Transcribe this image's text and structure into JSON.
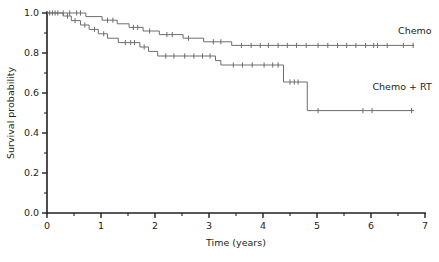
{
  "chart_data": {
    "type": "line",
    "title": "",
    "subtitle": "",
    "xlabel": "Time (years)",
    "ylabel": "Survival probability",
    "xlim": [
      0,
      7
    ],
    "ylim": [
      0,
      1.0
    ],
    "xticks": [
      0,
      1,
      2,
      3,
      4,
      5,
      6,
      7
    ],
    "xtick_labels": [
      "0",
      "1",
      "2",
      "3",
      "4",
      "5",
      "6",
      "7"
    ],
    "xminor_ticks": [
      0.5,
      1.5,
      2.5,
      3.5,
      4.5,
      5.5,
      6.5
    ],
    "yticks": [
      0.0,
      0.2,
      0.4,
      0.6,
      0.8,
      1.0
    ],
    "ytick_labels": [
      "0.0",
      "0.2",
      "0.4",
      "0.6",
      "0.8",
      "1.0"
    ],
    "yminor_ticks": [
      0.1,
      0.3,
      0.5,
      0.7,
      0.9
    ],
    "grid": false,
    "legend_position": "inline-right",
    "line_color": "#6e6e6e",
    "axis_color": "#231f20",
    "series": [
      {
        "name": "Chemo",
        "label": "Chemo",
        "label_x": 6.05,
        "label_y": 0.895,
        "steps": [
          [
            0.0,
            1.0
          ],
          [
            0.72,
            0.982
          ],
          [
            1.02,
            0.964
          ],
          [
            1.3,
            0.946
          ],
          [
            1.52,
            0.928
          ],
          [
            1.78,
            0.91
          ],
          [
            2.08,
            0.892
          ],
          [
            2.52,
            0.874
          ],
          [
            2.9,
            0.856
          ],
          [
            3.42,
            0.838
          ],
          [
            6.8,
            0.838
          ]
        ],
        "censor_times": [
          0.1,
          0.2,
          0.3,
          0.42,
          0.55,
          0.62,
          1.12,
          1.22,
          1.6,
          1.68,
          1.9,
          2.22,
          2.32,
          2.62,
          3.08,
          3.22,
          3.6,
          3.78,
          3.95,
          4.1,
          4.28,
          4.45,
          4.62,
          4.8,
          5.02,
          5.2,
          5.38,
          5.55,
          5.72,
          5.9,
          6.05,
          6.12,
          6.3,
          6.6,
          6.78
        ]
      },
      {
        "name": "Chemo + RT",
        "label": "Chemo + RT",
        "label_x": 6.05,
        "label_y": 0.615,
        "steps": [
          [
            0.0,
            1.0
          ],
          [
            0.3,
            0.985
          ],
          [
            0.45,
            0.962
          ],
          [
            0.62,
            0.94
          ],
          [
            0.78,
            0.918
          ],
          [
            0.95,
            0.896
          ],
          [
            1.12,
            0.874
          ],
          [
            1.32,
            0.852
          ],
          [
            1.72,
            0.83
          ],
          [
            1.88,
            0.808
          ],
          [
            2.05,
            0.785
          ],
          [
            3.12,
            0.762
          ],
          [
            3.22,
            0.74
          ],
          [
            4.38,
            0.655
          ],
          [
            4.82,
            0.512
          ],
          [
            6.8,
            0.512
          ]
        ],
        "censor_times": [
          0.05,
          0.15,
          0.38,
          0.52,
          0.7,
          0.88,
          1.05,
          1.45,
          1.55,
          1.62,
          1.8,
          2.2,
          2.35,
          2.55,
          2.72,
          2.88,
          3.02,
          3.45,
          3.62,
          3.8,
          4.02,
          4.18,
          4.28,
          4.5,
          4.58,
          4.65,
          5.02,
          5.85,
          6.02,
          6.75
        ]
      }
    ]
  }
}
